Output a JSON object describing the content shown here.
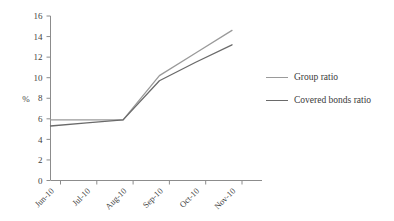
{
  "chart_data": {
    "type": "line",
    "title": "",
    "xlabel": "",
    "ylabel": "%",
    "categories": [
      "Jun-10",
      "Jul-10",
      "Aug-10",
      "Sep-10",
      "Oct-10",
      "Nov-10"
    ],
    "ylim": [
      0,
      16
    ],
    "ytick_step": 2,
    "yticks": [
      "0",
      "2",
      "4",
      "6",
      "8",
      "10",
      "12",
      "14",
      "16"
    ],
    "grid": false,
    "legend_position": "right",
    "series": [
      {
        "name": "Group ratio",
        "color": "#9a9a9a",
        "values": [
          5.9,
          5.9,
          5.9,
          10.2,
          12.4,
          14.6
        ]
      },
      {
        "name": "Covered bonds ratio",
        "color": "#6a6a6a",
        "values": [
          5.3,
          5.6,
          5.9,
          9.7,
          11.5,
          13.2
        ]
      }
    ]
  },
  "axes": {
    "y_axis_title": "%",
    "tick_color": "#8c8c8c",
    "axis_color": "#8c8c8c"
  },
  "legend": {
    "entries": [
      {
        "label": "Group ratio",
        "color": "#9a9a9a"
      },
      {
        "label": "Covered bonds ratio",
        "color": "#6a6a6a"
      }
    ]
  }
}
